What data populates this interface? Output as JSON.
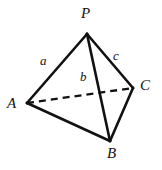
{
  "figure": {
    "kind": "geometry-diagram",
    "shape": "tetrahedron",
    "background_color": "#ffffff",
    "stroke_color": "#111111",
    "width": 162,
    "height": 170,
    "vertices": [
      {
        "id": "P",
        "label": "P",
        "x": 87,
        "y": 34,
        "label_x": 81,
        "label_y": 6
      },
      {
        "id": "A",
        "label": "A",
        "x": 27,
        "y": 103,
        "label_x": 7,
        "label_y": 96
      },
      {
        "id": "B",
        "label": "B",
        "x": 110,
        "y": 141,
        "label_x": 107,
        "label_y": 146
      },
      {
        "id": "C",
        "label": "C",
        "x": 133,
        "y": 88,
        "label_x": 140,
        "label_y": 78
      }
    ],
    "edges": [
      {
        "id": "PA",
        "from": "P",
        "to": "A",
        "style": "solid",
        "label": "a"
      },
      {
        "id": "PB",
        "from": "P",
        "to": "B",
        "style": "solid",
        "label": "b"
      },
      {
        "id": "PC",
        "from": "P",
        "to": "C",
        "style": "solid",
        "label": "c"
      },
      {
        "id": "AB",
        "from": "A",
        "to": "B",
        "style": "solid",
        "label": ""
      },
      {
        "id": "BC",
        "from": "B",
        "to": "C",
        "style": "solid",
        "label": ""
      },
      {
        "id": "AC",
        "from": "A",
        "to": "C",
        "style": "dashed",
        "label": ""
      }
    ],
    "edge_labels": [
      {
        "id": "a",
        "text": "a",
        "edge": "PA",
        "x": 40,
        "y": 54
      },
      {
        "id": "b",
        "text": "b",
        "edge": "PB",
        "x": 80,
        "y": 70
      },
      {
        "id": "c",
        "text": "c",
        "edge": "PC",
        "x": 113,
        "y": 49
      }
    ]
  }
}
